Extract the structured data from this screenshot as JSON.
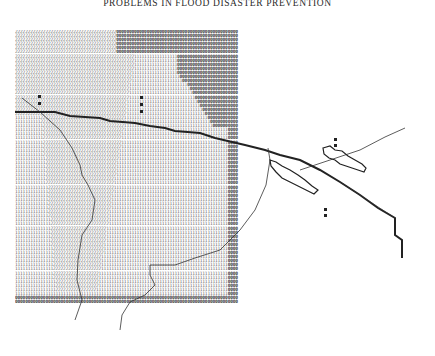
{
  "page": {
    "running_header": "PROBLEMS IN FLOOD DISASTER PREVENTION"
  },
  "figure": {
    "type": "line-printer character map",
    "legend_digits": [
      "0",
      "1",
      "2"
    ],
    "grid": {
      "cols": 88,
      "rows": 67,
      "zones": [
        {
          "digit": "2",
          "region": "left and upper-left"
        },
        {
          "digit": "1",
          "region": "center"
        },
        {
          "digit": "0",
          "region": "right edge and top-right"
        }
      ]
    },
    "features": [
      {
        "name": "river-channel",
        "description": "thick line descending from upper-left to lower-right"
      },
      {
        "name": "boundary-line-west",
        "description": "thin curving line west side"
      },
      {
        "name": "boundary-line-central",
        "description": "thin curving line central"
      },
      {
        "name": "levee-outline-upper",
        "description": "outlined cell cluster upper-right"
      },
      {
        "name": "levee-outline-lower",
        "description": "outlined cell cluster along channel"
      },
      {
        "name": "markers",
        "description": "small filled squares"
      }
    ]
  },
  "colors": {
    "ink": "#222222",
    "paper": "#ffffff"
  }
}
